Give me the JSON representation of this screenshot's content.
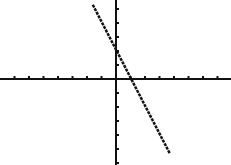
{
  "screen": {
    "background": "#ffffff",
    "ink": "#111111"
  },
  "chart_data": {
    "type": "line",
    "title": "",
    "xlabel": "",
    "ylabel": "",
    "xlim": [
      -8,
      8
    ],
    "ylim": [
      -5.5,
      5.5
    ],
    "grid": false,
    "axes_pixel": {
      "x_axis_y": 79,
      "y_axis_x": 116
    },
    "tick_spacing_px": {
      "x": 14.5,
      "y": 14
    },
    "series": [
      {
        "name": "Y1",
        "equation": "y = -2x + 2",
        "x": [
          -1.6,
          3.7
        ],
        "y": [
          5.3,
          -5.3
        ],
        "slope": -2,
        "y_intercept": 2,
        "x_intercept": 1
      }
    ]
  }
}
